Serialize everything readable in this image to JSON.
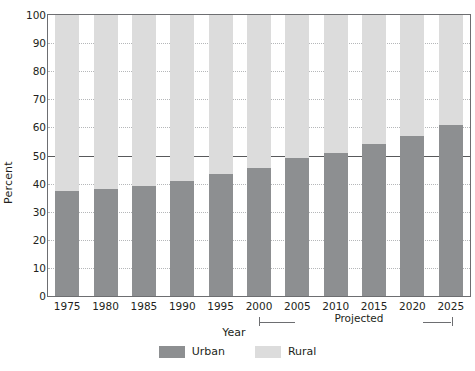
{
  "chart_data": {
    "type": "bar",
    "subtype": "stacked-100-percent",
    "title": "",
    "xlabel": "Year",
    "ylabel": "Percent",
    "ylim": [
      0,
      100
    ],
    "ytick_step": 10,
    "yticks": [
      0,
      10,
      20,
      30,
      40,
      50,
      60,
      70,
      80,
      90,
      100
    ],
    "grid": true,
    "grid_style": "dotted",
    "reference_line": 50,
    "legend_position": "bottom-center",
    "categories": [
      "1975",
      "1980",
      "1985",
      "1990",
      "1995",
      "2000",
      "2005",
      "2010",
      "2015",
      "2020",
      "2025"
    ],
    "series": [
      {
        "name": "Urban",
        "color": "#8d8f91",
        "values": [
          37.5,
          38,
          39,
          41,
          43.5,
          45.5,
          49,
          51,
          54,
          57,
          61
        ]
      },
      {
        "name": "Rural",
        "color": "#dcdcdc",
        "values": [
          62.5,
          62,
          61,
          59,
          56.5,
          54.5,
          51,
          49,
          46,
          43,
          39
        ]
      }
    ],
    "annotations": [
      {
        "text": "Projected",
        "type": "bracket",
        "from_category": "2000",
        "to_category": "2025"
      }
    ]
  },
  "legend": {
    "items": [
      {
        "label": "Urban",
        "color": "#8d8f91",
        "swatch_name": "legend-swatch-urban"
      },
      {
        "label": "Rural",
        "color": "#dcdcdc",
        "swatch_name": "legend-swatch-rural"
      }
    ]
  },
  "colors": {
    "urban": "#8d8f91",
    "rural": "#dcdcdc",
    "axis": "#6d6e71",
    "grid": "#b5b7b9",
    "reference_line": "#58595b",
    "text": "#231f20",
    "background": "#ffffff"
  }
}
